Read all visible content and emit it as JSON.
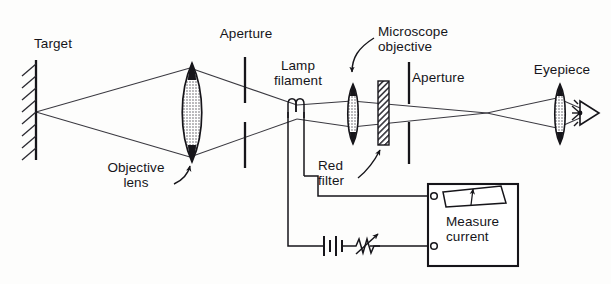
{
  "figure": {
    "type": "optical-bench-diagram",
    "background_color": "#fdfdfc",
    "ink_color": "#16151a"
  },
  "labels": {
    "target": "Target",
    "aperture_left": "Aperture",
    "objective_lens": "Objective\nlens",
    "lamp_filament": "Lamp\nfilament",
    "microscope_objective": "Microscope\nobjective",
    "red_filter": "Red\nfilter",
    "aperture_right": "Aperture",
    "eyepiece": "Eyepiece",
    "measure_current": "Measure\ncurrent"
  },
  "components": [
    {
      "name": "target",
      "kind": "hatched-wall",
      "x": 33,
      "label": "Target"
    },
    {
      "name": "objective-lens",
      "kind": "biconvex-lens",
      "x": 192,
      "label": "Objective lens"
    },
    {
      "name": "aperture-left",
      "kind": "slit-aperture",
      "x": 245,
      "label": "Aperture"
    },
    {
      "name": "lamp-filament",
      "kind": "filament-coil",
      "x": 297,
      "label": "Lamp filament"
    },
    {
      "name": "microscope-objective",
      "kind": "biconvex-lens",
      "x": 353,
      "label": "Microscope objective"
    },
    {
      "name": "red-filter",
      "kind": "hatched-plate",
      "x": 383,
      "label": "Red filter"
    },
    {
      "name": "aperture-right",
      "kind": "slit-aperture",
      "x": 409,
      "label": "Aperture"
    },
    {
      "name": "eyepiece",
      "kind": "biconvex-lens",
      "x": 560,
      "label": "Eyepiece"
    },
    {
      "name": "observer-eye",
      "kind": "eye-symbol",
      "x": 586,
      "label": ""
    }
  ],
  "circuit": {
    "battery": {
      "name": "battery",
      "cells": 2
    },
    "rheostat": {
      "name": "variable-resistor",
      "style": "zigzag-with-arrow"
    },
    "meter": {
      "name": "current-meter",
      "box": {
        "x": 428,
        "y": 184,
        "w": 90,
        "h": 82
      },
      "gauge": "arc-scale-with-needle",
      "caption": "Measure\ncurrent",
      "terminals": 2
    }
  },
  "optical_axis_y": 112,
  "rays": {
    "object_point_y": 112,
    "crossings": [
      {
        "name": "filament-image",
        "x": 297,
        "y": 112
      },
      {
        "name": "intermediate-image",
        "x": 487,
        "y": 113
      }
    ]
  }
}
